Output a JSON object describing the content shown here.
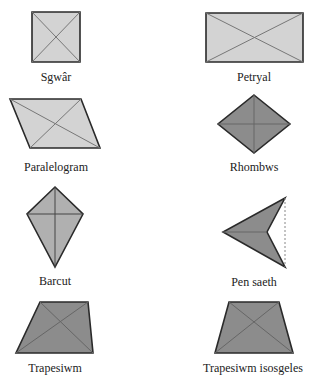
{
  "colors": {
    "light_fill": "#d3d3d3",
    "dark_fill": "#8c8c8c",
    "outline": "#2a2a2a",
    "diagonal": "#777777",
    "dashed": "#888888"
  },
  "shapes": [
    {
      "id": "square",
      "label": "Sgwâr",
      "points": "32,12 80,12 80,62 32,62",
      "fill": "light",
      "diagonals": [
        [
          32,
          12,
          80,
          62
        ],
        [
          80,
          12,
          32,
          62
        ]
      ],
      "label_pos": [
        56,
        70
      ]
    },
    {
      "id": "rectangle",
      "label": "Petryal",
      "points": "206,13 303,13 303,62 206,62",
      "fill": "light",
      "diagonals": [
        [
          206,
          13,
          303,
          62
        ],
        [
          303,
          13,
          206,
          62
        ]
      ],
      "label_pos": [
        254,
        70
      ]
    },
    {
      "id": "parallelogram",
      "label": "Paralelogram",
      "points": "10,99 81,99 100,148 30,148",
      "fill": "light",
      "diagonals": [
        [
          10,
          99,
          100,
          148
        ],
        [
          81,
          99,
          30,
          148
        ]
      ],
      "label_pos": [
        56,
        160
      ]
    },
    {
      "id": "rhombus",
      "label": "Rhombws",
      "points": "254,95 290,124 254,153 218,124",
      "fill": "dark",
      "diagonals": [
        [
          254,
          95,
          254,
          153
        ],
        [
          218,
          124,
          290,
          124
        ]
      ],
      "label_pos": [
        254,
        160
      ]
    },
    {
      "id": "kite",
      "label": "Barcut",
      "points": "55,187 83,214 55,267 27,214",
      "fill": "medium",
      "diagonals": [
        [
          55,
          187,
          55,
          267
        ],
        [
          27,
          214,
          83,
          214
        ]
      ],
      "label_pos": [
        55,
        274
      ]
    },
    {
      "id": "arrowhead",
      "label": "Pen saeth",
      "points": "285,198 267,232 285,267 223,232",
      "fill": "dark",
      "diagonals": [
        [
          223,
          232,
          267,
          232
        ]
      ],
      "dashed": [
        285,
        198,
        285,
        267
      ],
      "label_pos": [
        254,
        275
      ]
    },
    {
      "id": "trapezium",
      "label": "Trapesiwm",
      "points": "40,302 88,302 93,353 16,353",
      "fill": "dark",
      "diagonals": [
        [
          40,
          302,
          93,
          353
        ],
        [
          88,
          302,
          16,
          353
        ]
      ],
      "label_pos": [
        55,
        361
      ]
    },
    {
      "id": "isosceles-trapezium",
      "label": "Trapesiwm isosgeles",
      "points": "229,302 279,302 293,353 215,353",
      "fill": "dark",
      "diagonals": [
        [
          229,
          302,
          293,
          353
        ],
        [
          279,
          302,
          215,
          353
        ]
      ],
      "label_pos": [
        203,
        361
      ],
      "label_left_anchored": true
    }
  ],
  "labels": {
    "square": "Sgwâr",
    "rectangle": "Petryal",
    "parallelogram": "Paralelogram",
    "rhombus": "Rhombws",
    "kite": "Barcut",
    "arrowhead": "Pen saeth",
    "trapezium": "Trapesiwm",
    "isosceles_trapezium": "Trapesiwm isosgeles"
  }
}
